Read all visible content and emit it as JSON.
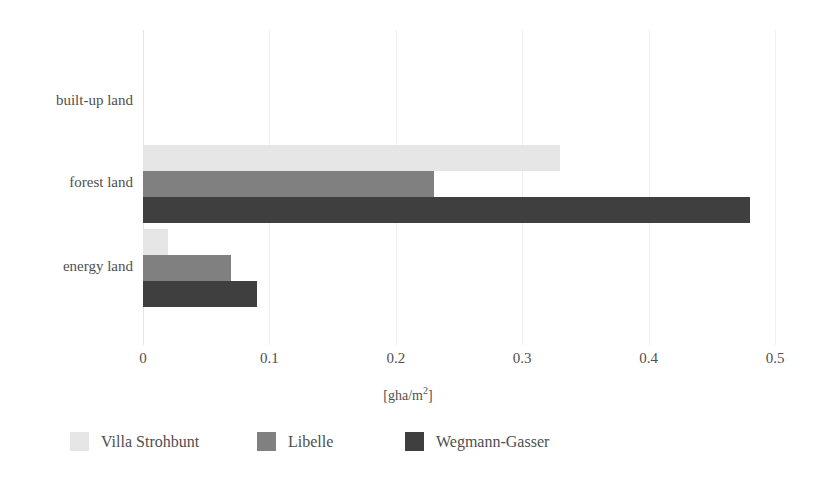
{
  "chart_data": {
    "type": "bar",
    "orientation": "horizontal",
    "title": "",
    "subtitle": "",
    "xlabel": "[gha/m2]",
    "xlabel_base": "[gha/m",
    "xlabel_sup": "2",
    "xlabel_tail": "]",
    "ylabel": "",
    "categories": [
      "built-up land",
      "forest land",
      "energy land"
    ],
    "series": [
      {
        "name": "Villa Strohbunt",
        "color": "#e6e6e6",
        "values": [
          0,
          0.33,
          0.02
        ]
      },
      {
        "name": "Libelle",
        "color": "#808080",
        "values": [
          0,
          0.23,
          0.07
        ]
      },
      {
        "name": "Wegmann-Gasser",
        "color": "#3f3f3f",
        "values": [
          0,
          0.48,
          0.09
        ]
      }
    ],
    "xlim": [
      0,
      0.5
    ],
    "xticks": [
      0,
      0.1,
      0.2,
      0.3,
      0.4,
      0.5
    ],
    "xtick_labels": [
      "0",
      "0.1",
      "0.2",
      "0.3",
      "0.4",
      "0.5"
    ],
    "grid": true,
    "grid_axis": "x",
    "legend_position": "bottom"
  },
  "axis": {
    "ticks": [
      {
        "label": "0",
        "value": 0
      },
      {
        "label": "0.1",
        "value": 0.1
      },
      {
        "label": "0.2",
        "value": 0.2
      },
      {
        "label": "0.3",
        "value": 0.3
      },
      {
        "label": "0.4",
        "value": 0.4
      },
      {
        "label": "0.5",
        "value": 0.5
      }
    ]
  },
  "categories": [
    {
      "label": "built-up land"
    },
    {
      "label": "forest land"
    },
    {
      "label": "energy land"
    }
  ],
  "legend": {
    "items": [
      {
        "label": "Villa Strohbunt",
        "color": "#e6e6e6"
      },
      {
        "label": "Libelle",
        "color": "#808080"
      },
      {
        "label": "Wegmann-Gasser",
        "color": "#3f3f3f"
      }
    ]
  }
}
